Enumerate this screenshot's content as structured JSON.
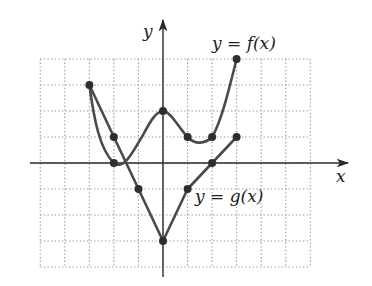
{
  "chart_data": {
    "type": "line",
    "title": "",
    "xlabel": "x",
    "ylabel": "y",
    "xlim": [
      -5,
      6
    ],
    "ylim": [
      -4,
      4
    ],
    "grid": true,
    "grid_style": "dotted",
    "legend": "inline labels near curves",
    "series": [
      {
        "name": "y = f(x)",
        "kind": "smooth curve",
        "marked_points": [
          [
            -3,
            3
          ],
          [
            -2,
            0
          ],
          [
            0,
            2
          ],
          [
            1,
            1
          ],
          [
            2,
            1
          ],
          [
            3,
            4
          ]
        ],
        "x": [
          -3,
          -2,
          0,
          1,
          2,
          3
        ],
        "y": [
          3,
          0,
          2,
          1,
          1,
          4
        ]
      },
      {
        "name": "y = g(x)",
        "kind": "piecewise linear",
        "marked_points": [
          [
            -3,
            3
          ],
          [
            -2,
            1
          ],
          [
            -1,
            -1
          ],
          [
            0,
            -3
          ],
          [
            1,
            -1
          ],
          [
            2,
            0
          ],
          [
            3,
            1
          ]
        ],
        "x": [
          -3,
          -2,
          -1,
          0,
          1,
          2,
          3
        ],
        "y": [
          3,
          1,
          -1,
          -3,
          -1,
          0,
          1
        ]
      }
    ]
  },
  "labels": {
    "x_axis": "x",
    "y_axis": "y",
    "f_label_lhs": "y",
    "f_label_eq": "=",
    "f_label_rhs": "f(x)",
    "g_label_lhs": "y",
    "g_label_eq": "=",
    "g_label_rhs": "g(x)"
  },
  "colors": {
    "curve": "#4a4a4a",
    "point": "#2e2e2e",
    "axis": "#2a2a2a",
    "grid": "#9a9a9a"
  }
}
